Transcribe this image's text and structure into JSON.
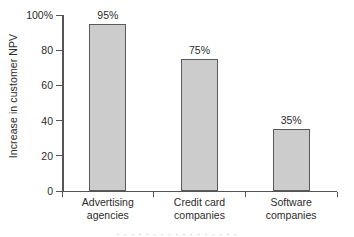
{
  "chart_data": {
    "type": "bar",
    "title": "",
    "xlabel": "",
    "ylabel": "Increase in customer NPV",
    "ylim": [
      0,
      100
    ],
    "grid": false,
    "legend": "none",
    "categories": [
      "Advertising agencies",
      "Credit card companies",
      "Software companies"
    ],
    "category_lines": [
      [
        "Advertising",
        "agencies"
      ],
      [
        "Credit card",
        "companies"
      ],
      [
        "Software",
        "companies"
      ]
    ],
    "values": [
      95,
      75,
      35
    ],
    "value_labels": [
      "95%",
      "75%",
      "35%"
    ],
    "ytick_values": [
      0,
      20,
      40,
      60,
      80,
      100
    ],
    "ytick_labels": [
      "0",
      "20",
      "40",
      "60",
      "80",
      "100%"
    ],
    "bar_color": "#cccccc",
    "bar_border_color": "#5a5a5a",
    "axis_color": "#555555",
    "text_color": "#2b2b2b"
  },
  "caption": {
    "fragment": "· · ·  · ·   · ·    · · ·   · · ·  ·    · · ·"
  }
}
